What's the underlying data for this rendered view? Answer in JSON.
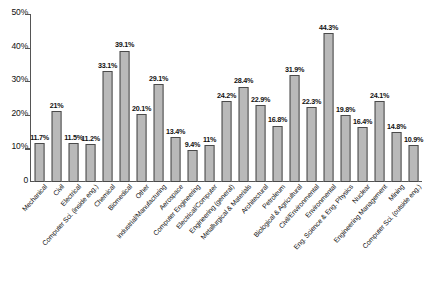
{
  "chart_data": {
    "type": "bar",
    "title": "",
    "xlabel": "",
    "ylabel": "",
    "ylim": [
      0,
      50
    ],
    "grid": false,
    "legend": null,
    "y_tick_labels": [
      "50%",
      "40%",
      "30%",
      "20%",
      "10%",
      "0"
    ],
    "y_tick_values": [
      50,
      40,
      30,
      20,
      10,
      0
    ],
    "categories": [
      "Mechanical",
      "Civil",
      "Electrical",
      "Computer Sci. (inside eng.)",
      "Chemical",
      "Biomedical",
      "Other",
      "Industrial/Manufacturing",
      "Aerospace",
      "Computer Engineering",
      "Electrical/Computer",
      "Engineering (general)",
      "Metallurgical & Materials",
      "Architectural",
      "Petroleum",
      "Biological & Agricultural",
      "Civil/Environmental",
      "Environmental",
      "Eng. Science & Eng. Physics",
      "Nuclear",
      "Engineering Management",
      "Mining",
      "Computer Sci. (outside eng.)"
    ],
    "values": [
      11.7,
      21,
      11.5,
      11.2,
      33.1,
      39.1,
      20.1,
      29.1,
      13.4,
      9.4,
      11,
      24.2,
      28.4,
      22.9,
      16.8,
      31.9,
      22.3,
      44.3,
      19.8,
      16.4,
      24.1,
      14.8,
      10.9
    ],
    "data_labels": [
      "11.7%",
      "21%",
      "11.5%",
      "11.2%",
      "33.1%",
      "39.1%",
      "20.1%",
      "29.1%",
      "13.4%",
      "9.4%",
      "11%",
      "24.2%",
      "28.4%",
      "22.9%",
      "16.8%",
      "31.9%",
      "22.3%",
      "44.3%",
      "19.8%",
      "16.4%",
      "24.1%",
      "14.8%",
      "10.9%"
    ],
    "bar_color": "#b9b9b9",
    "bar_border_color": "#4a4a4a",
    "axis_color": "#555555"
  },
  "caption": {
    "text": ""
  }
}
